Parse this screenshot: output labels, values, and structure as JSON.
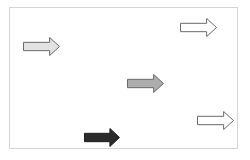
{
  "frame": {
    "border_color": "#d4d4d4",
    "background": "#ffffff"
  },
  "arrows": [
    {
      "id": "arrow-1",
      "direction": "right",
      "x": 23,
      "y": 37,
      "w": 37,
      "h": 19,
      "fill": "#e2e2e2",
      "stroke": "#6a6a6a"
    },
    {
      "id": "arrow-2",
      "direction": "right",
      "x": 180,
      "y": 18,
      "w": 37,
      "h": 19,
      "fill": "#ffffff",
      "stroke": "#6a6a6a"
    },
    {
      "id": "arrow-3",
      "direction": "right",
      "x": 127,
      "y": 74,
      "w": 37,
      "h": 19,
      "fill": "#adadad",
      "stroke": "#6a6a6a"
    },
    {
      "id": "arrow-4",
      "direction": "right",
      "x": 197,
      "y": 111,
      "w": 37,
      "h": 19,
      "fill": "#ffffff",
      "stroke": "#6a6a6a"
    },
    {
      "id": "arrow-5",
      "direction": "right",
      "x": 84,
      "y": 128,
      "w": 36,
      "h": 19,
      "fill": "#2b2b2b",
      "stroke": "#1e1e1e"
    }
  ]
}
